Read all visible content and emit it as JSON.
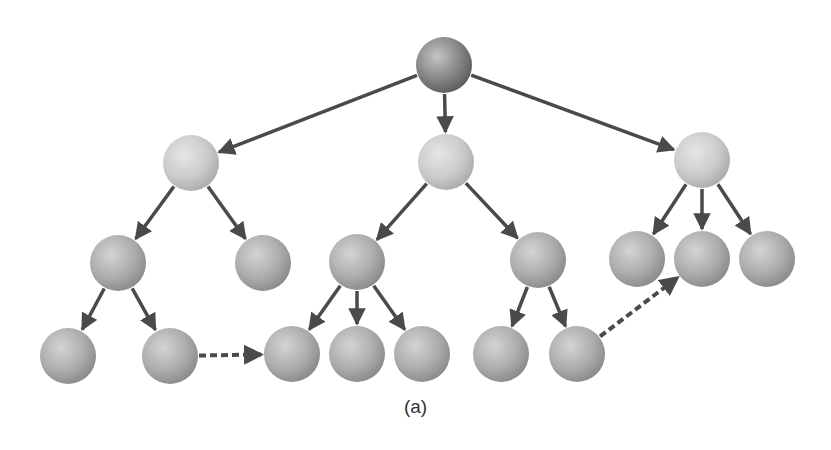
{
  "caption": "(a)",
  "colors": {
    "root": "#7e7e7e",
    "level1": "#cfcfcf",
    "node": "#b3b3b3",
    "edge": "#4a4a4a",
    "background": "#ffffff"
  },
  "node_radius": 28,
  "nodes": [
    {
      "id": "root",
      "x": 444,
      "y": 65,
      "level": 0
    },
    {
      "id": "n1a",
      "x": 191,
      "y": 163,
      "level": 1
    },
    {
      "id": "n1b",
      "x": 446,
      "y": 162,
      "level": 1
    },
    {
      "id": "n1c",
      "x": 702,
      "y": 160,
      "level": 1
    },
    {
      "id": "n2a",
      "x": 118,
      "y": 263,
      "level": 2
    },
    {
      "id": "n2b",
      "x": 263,
      "y": 263,
      "level": 2
    },
    {
      "id": "n2c",
      "x": 357,
      "y": 262,
      "level": 2
    },
    {
      "id": "n2d",
      "x": 538,
      "y": 260,
      "level": 2
    },
    {
      "id": "n2e",
      "x": 637,
      "y": 259,
      "level": 2
    },
    {
      "id": "n2f",
      "x": 702,
      "y": 259,
      "level": 2
    },
    {
      "id": "n2g",
      "x": 767,
      "y": 259,
      "level": 2
    },
    {
      "id": "n3a",
      "x": 68,
      "y": 356,
      "level": 3
    },
    {
      "id": "n3b",
      "x": 170,
      "y": 356,
      "level": 3
    },
    {
      "id": "n3c",
      "x": 292,
      "y": 354,
      "level": 3
    },
    {
      "id": "n3d",
      "x": 357,
      "y": 354,
      "level": 3
    },
    {
      "id": "n3e",
      "x": 422,
      "y": 354,
      "level": 3
    },
    {
      "id": "n3f",
      "x": 501,
      "y": 354,
      "level": 3
    },
    {
      "id": "n3g",
      "x": 577,
      "y": 354,
      "level": 3
    }
  ],
  "edges": [
    {
      "from": "root",
      "to": "n1a",
      "style": "solid"
    },
    {
      "from": "root",
      "to": "n1b",
      "style": "solid"
    },
    {
      "from": "root",
      "to": "n1c",
      "style": "solid"
    },
    {
      "from": "n1a",
      "to": "n2a",
      "style": "solid"
    },
    {
      "from": "n1a",
      "to": "n2b",
      "style": "solid"
    },
    {
      "from": "n1b",
      "to": "n2c",
      "style": "solid"
    },
    {
      "from": "n1b",
      "to": "n2d",
      "style": "solid"
    },
    {
      "from": "n1c",
      "to": "n2e",
      "style": "solid"
    },
    {
      "from": "n1c",
      "to": "n2f",
      "style": "solid"
    },
    {
      "from": "n1c",
      "to": "n2g",
      "style": "solid"
    },
    {
      "from": "n2a",
      "to": "n3a",
      "style": "solid"
    },
    {
      "from": "n2a",
      "to": "n3b",
      "style": "solid"
    },
    {
      "from": "n2c",
      "to": "n3c",
      "style": "solid"
    },
    {
      "from": "n2c",
      "to": "n3d",
      "style": "solid"
    },
    {
      "from": "n2c",
      "to": "n3e",
      "style": "solid"
    },
    {
      "from": "n2d",
      "to": "n3f",
      "style": "solid"
    },
    {
      "from": "n2d",
      "to": "n3g",
      "style": "solid"
    },
    {
      "from": "n3b",
      "to": "n3c",
      "style": "dashed"
    },
    {
      "from": "n3g",
      "to": "n2f",
      "style": "dashed"
    }
  ]
}
